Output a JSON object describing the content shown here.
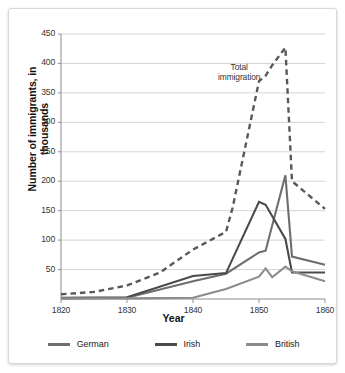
{
  "chart_data": {
    "type": "line",
    "title": "",
    "xlabel": "Year",
    "ylabel": "Number of immigrants, in thousands",
    "xlim": [
      1820,
      1860
    ],
    "ylim": [
      0,
      450
    ],
    "xticks": [
      "1820",
      "1830",
      "1840",
      "1850",
      "1860"
    ],
    "yticks": [
      "450",
      "400",
      "350",
      "300",
      "250",
      "200",
      "150",
      "100",
      "50"
    ],
    "grid": true,
    "legend_position": "bottom",
    "annotations": [
      {
        "text": "Total immigration",
        "x": 1847,
        "y": 385
      }
    ],
    "series": [
      {
        "name": "Total immigration",
        "style": "dashed",
        "color": "#58585a",
        "in_legend": false,
        "x": [
          1820,
          1825,
          1830,
          1835,
          1840,
          1845,
          1846,
          1850,
          1851,
          1852,
          1854,
          1855,
          1860
        ],
        "values": [
          8,
          12,
          23,
          45,
          84,
          114,
          155,
          370,
          379,
          397,
          427,
          200,
          153
        ]
      },
      {
        "name": "German",
        "style": "solid",
        "color": "#6d6e71",
        "in_legend": true,
        "x": [
          1820,
          1830,
          1840,
          1845,
          1850,
          1851,
          1854,
          1855,
          1860
        ],
        "values": [
          1,
          2,
          30,
          43,
          79,
          82,
          210,
          72,
          58
        ]
      },
      {
        "name": "Irish",
        "style": "solid",
        "color": "#4a4a4c",
        "in_legend": true,
        "x": [
          1820,
          1830,
          1840,
          1845,
          1850,
          1851,
          1854,
          1855,
          1860
        ],
        "values": [
          2,
          3,
          39,
          44,
          165,
          160,
          102,
          45,
          45
        ]
      },
      {
        "name": "British",
        "style": "solid",
        "color": "#8b8c8e",
        "in_legend": true,
        "x": [
          1820,
          1830,
          1840,
          1845,
          1850,
          1851,
          1852,
          1854,
          1855,
          1860
        ],
        "values": [
          1,
          1,
          2,
          17,
          38,
          52,
          37,
          55,
          47,
          30
        ]
      }
    ]
  },
  "legend": {
    "items": [
      {
        "label": "German",
        "color": "#6d6e71"
      },
      {
        "label": "Irish",
        "color": "#4a4a4c"
      },
      {
        "label": "British",
        "color": "#8b8c8e"
      }
    ]
  },
  "axes": {
    "x_title": "Year",
    "y_title": "Number of immigrants, in thousands"
  }
}
